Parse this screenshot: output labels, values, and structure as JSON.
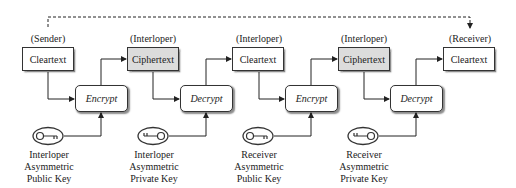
{
  "diagram": {
    "roles": [
      "(Sender)",
      "(Interloper)",
      "(Interloper)",
      "(Interloper)",
      "(Receiver)"
    ],
    "text_boxes": [
      {
        "label": "Cleartext",
        "type": "cleartext"
      },
      {
        "label": "Ciphertext",
        "type": "ciphertext"
      },
      {
        "label": "Cleartext",
        "type": "cleartext"
      },
      {
        "label": "Ciphertext",
        "type": "ciphertext"
      },
      {
        "label": "Cleartext",
        "type": "cleartext"
      }
    ],
    "operations": [
      {
        "label": "Encrypt"
      },
      {
        "label": "Decrypt"
      },
      {
        "label": "Encrypt"
      },
      {
        "label": "Decrypt"
      }
    ],
    "keys": [
      {
        "line1": "Interloper",
        "line2": "Asymmetric",
        "line3": "Public Key",
        "icon": "public-key-icon"
      },
      {
        "line1": "Interloper",
        "line2": "Asymmetric",
        "line3": "Private Key",
        "icon": "private-key-icon"
      },
      {
        "line1": "Receiver",
        "line2": "Asymmetric",
        "line3": "Public Key",
        "icon": "public-key-icon"
      },
      {
        "line1": "Receiver",
        "line2": "Asymmetric",
        "line3": "Private Key",
        "icon": "private-key-icon"
      }
    ],
    "colors": {
      "ciphertext_fill": "#dcdcdc",
      "stroke": "#333333"
    }
  }
}
